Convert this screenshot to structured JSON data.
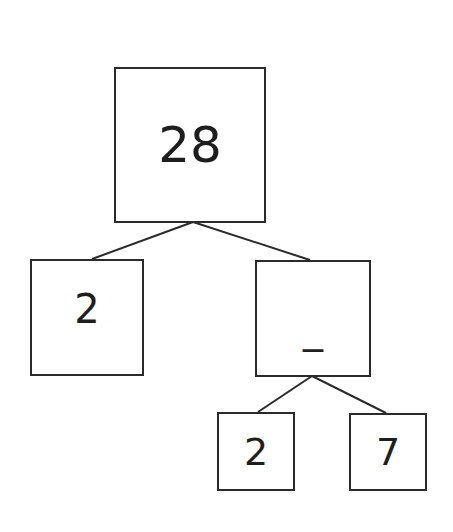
{
  "diagram": {
    "type": "factor-tree",
    "root": {
      "value": "28"
    },
    "level1": [
      {
        "value": "2"
      },
      {
        "value": "_"
      }
    ],
    "level2": [
      {
        "value": "2"
      },
      {
        "value": "7"
      }
    ],
    "colors": {
      "stroke": "#2a2a2a",
      "text": "#1e1e1e",
      "background": "#ffffff"
    }
  }
}
